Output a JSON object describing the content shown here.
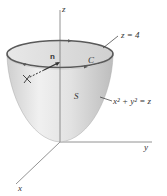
{
  "figure": {
    "type": "3d-surface-diagram",
    "labels": {
      "z_axis": "z",
      "y_axis": "y",
      "x_axis": "x",
      "plane": "z = 4",
      "curve": "C",
      "surface": "S",
      "equation": "x² + y² = z",
      "normal": "n"
    },
    "colors": {
      "surface_fill": "#d9d9d9",
      "rim": "#5a5a5a",
      "axis": "#777777",
      "text": "#333333"
    }
  }
}
